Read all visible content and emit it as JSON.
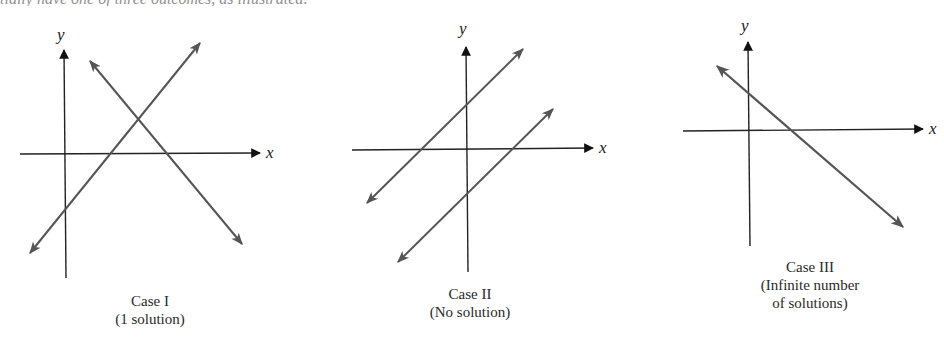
{
  "page": {
    "top_text_fragment": "tially have one of three outcomes, as illustrated:"
  },
  "colors": {
    "axis": "#222222",
    "line": "#555555",
    "background": "#ffffff",
    "text": "#2a2a2a"
  },
  "cases": [
    {
      "id": "case-1",
      "title": "Case I",
      "subtitle": "(1 solution)",
      "x_label": "x",
      "y_label": "y",
      "lines": 2,
      "description": "Two lines intersect at one point"
    },
    {
      "id": "case-2",
      "title": "Case II",
      "subtitle": "(No solution)",
      "x_label": "x",
      "y_label": "y",
      "lines": 2,
      "description": "Two parallel lines never intersect"
    },
    {
      "id": "case-3",
      "title": "Case III",
      "subtitle_line1": "(Infinite number",
      "subtitle_line2": "of solutions)",
      "x_label": "x",
      "y_label": "y",
      "lines": 1,
      "description": "Two coincident lines (drawn as one)"
    }
  ]
}
